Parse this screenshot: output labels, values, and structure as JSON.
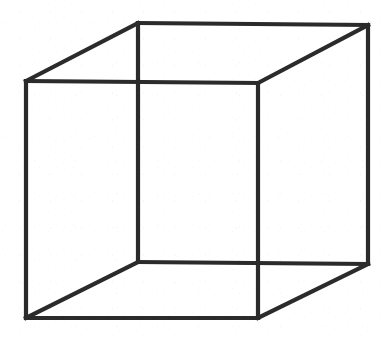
{
  "figure": {
    "name": "Necker cube",
    "type": "line-drawing",
    "canvas": {
      "width": 391,
      "height": 341
    },
    "background_color": "#ffffff",
    "stroke_color": "#2b2b2b",
    "stroke_width_px": 4.2,
    "text_labels": [],
    "vertices": {
      "front_top_left": {
        "x": 26,
        "y": 81
      },
      "front_top_right": {
        "x": 258,
        "y": 83
      },
      "front_bottom_right": {
        "x": 258,
        "y": 318
      },
      "front_bottom_left": {
        "x": 26,
        "y": 318
      },
      "back_top_left": {
        "x": 138,
        "y": 23
      },
      "back_top_right": {
        "x": 368,
        "y": 25
      },
      "back_bottom_right": {
        "x": 368,
        "y": 264
      },
      "back_bottom_left": {
        "x": 138,
        "y": 262
      }
    },
    "edges": [
      {
        "id": "front-top",
        "label": "front face top edge",
        "from": "front_top_left",
        "to": "front_top_right"
      },
      {
        "id": "front-right",
        "label": "front face right edge",
        "from": "front_top_right",
        "to": "front_bottom_right"
      },
      {
        "id": "front-bottom",
        "label": "front face bottom edge",
        "from": "front_bottom_right",
        "to": "front_bottom_left"
      },
      {
        "id": "front-left",
        "label": "front face left edge",
        "from": "front_bottom_left",
        "to": "front_top_left"
      },
      {
        "id": "back-top",
        "label": "back face top edge",
        "from": "back_top_left",
        "to": "back_top_right"
      },
      {
        "id": "back-right",
        "label": "back face right edge",
        "from": "back_top_right",
        "to": "back_bottom_right"
      },
      {
        "id": "back-bottom",
        "label": "back face bottom edge",
        "from": "back_bottom_right",
        "to": "back_bottom_left"
      },
      {
        "id": "back-left",
        "label": "back face left edge",
        "from": "back_bottom_left",
        "to": "back_top_left"
      },
      {
        "id": "link-tl",
        "label": "top-left connecting edge",
        "from": "front_top_left",
        "to": "back_top_left"
      },
      {
        "id": "link-tr",
        "label": "top-right connecting edge",
        "from": "front_top_right",
        "to": "back_top_right"
      },
      {
        "id": "link-br",
        "label": "bottom-right connecting edge",
        "from": "front_bottom_right",
        "to": "back_bottom_right"
      },
      {
        "id": "link-bl",
        "label": "bottom-left connecting edge",
        "from": "front_bottom_left",
        "to": "back_bottom_left"
      }
    ]
  }
}
